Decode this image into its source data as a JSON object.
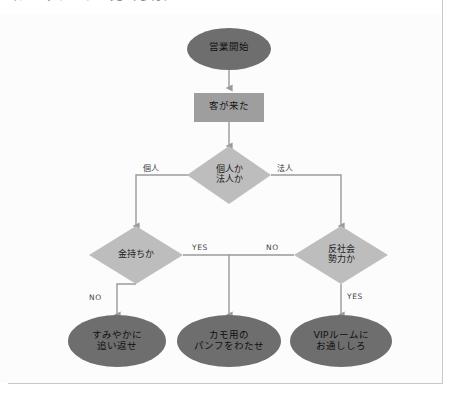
{
  "caption": {
    "text": "（クリップされた見出し行）"
  },
  "diagram": {
    "colors": {
      "terminator_fill": "#6e6e6e",
      "process_fill": "#9e9e9e",
      "decision_fill": "#bdbdbd",
      "connector": "#9a9a9a",
      "frame_rule": "#c9c9c9",
      "page_background": "#ffffff",
      "label_text": "#1a1a1a"
    },
    "nodes": [
      {
        "id": "start",
        "shape": "terminator",
        "label": "営業開始",
        "lines": [
          "営業開始"
        ]
      },
      {
        "id": "customer-arrived",
        "shape": "process",
        "label": "客が来た",
        "lines": [
          "客が来た"
        ]
      },
      {
        "id": "individual-or-corporate",
        "shape": "decision",
        "label": "個人か法人か",
        "lines": [
          "個人か",
          "法人か"
        ]
      },
      {
        "id": "is-rich",
        "shape": "decision",
        "label": "金持ちか",
        "lines": [
          "金持ちか"
        ]
      },
      {
        "id": "is-antisocial",
        "shape": "decision",
        "label": "反社会勢力か",
        "lines": [
          "反社会",
          "勢力か"
        ]
      },
      {
        "id": "drive-away",
        "shape": "terminator",
        "label": "すみやかに追い返せ",
        "lines": [
          "すみやかに",
          "追い返せ"
        ]
      },
      {
        "id": "give-pamphlet",
        "shape": "terminator",
        "label": "カモ用のパンフをわたせ",
        "lines": [
          "カモ用の",
          "パンフをわたせ"
        ]
      },
      {
        "id": "vip-room",
        "shape": "terminator",
        "label": "VIPルームにお通ししろ",
        "lines": [
          "VIPルームに",
          "お通ししろ"
        ]
      }
    ],
    "edges": [
      {
        "id": "start-to-customer",
        "from": "start",
        "to": "customer-arrived",
        "label": ""
      },
      {
        "id": "customer-to-decision",
        "from": "customer-arrived",
        "to": "individual-or-corporate",
        "label": ""
      },
      {
        "id": "decision-to-rich",
        "from": "individual-or-corporate",
        "to": "is-rich",
        "label": "個人"
      },
      {
        "id": "decision-to-antisocial",
        "from": "individual-or-corporate",
        "to": "is-antisocial",
        "label": "法人"
      },
      {
        "id": "rich-no-drive-away",
        "from": "is-rich",
        "to": "drive-away",
        "label": "NO"
      },
      {
        "id": "rich-yes-pamphlet",
        "from": "is-rich",
        "to": "give-pamphlet",
        "label": "YES"
      },
      {
        "id": "antisocial-no-pamphlet",
        "from": "is-antisocial",
        "to": "give-pamphlet",
        "label": "NO"
      },
      {
        "id": "antisocial-yes-vip",
        "from": "is-antisocial",
        "to": "vip-room",
        "label": "YES"
      }
    ]
  }
}
